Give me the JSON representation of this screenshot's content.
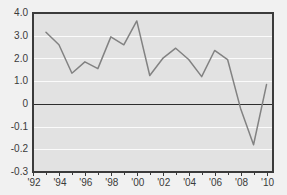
{
  "chart_data": {
    "type": "line",
    "title": "",
    "subtitle": "",
    "xlabel": "",
    "ylabel": "",
    "grid": true,
    "legend": false,
    "legend_position": "none",
    "line_color": "#828282",
    "plot_background_color": "#e2e2e2",
    "gridline_color": "#fbfbfb",
    "axis_color": "#3b3b3b",
    "zero_line_color": "#2e2e2e",
    "page_background_color": "#f1f1f1",
    "x": [
      1993,
      1994,
      1995,
      1996,
      1997,
      1998,
      1999,
      2000,
      2001,
      2002,
      2003,
      2004,
      2005,
      2006,
      2007,
      2008,
      2009,
      2010
    ],
    "values": [
      3.15,
      2.6,
      1.35,
      1.85,
      1.55,
      2.95,
      2.6,
      3.65,
      1.25,
      2.0,
      2.45,
      1.95,
      1.2,
      2.35,
      1.95,
      -0.02,
      -0.18,
      0.85
    ],
    "series": [
      {
        "name": "",
        "values": [
          3.15,
          2.6,
          1.35,
          1.85,
          1.55,
          2.95,
          2.6,
          3.65,
          1.25,
          2.0,
          2.45,
          1.95,
          1.2,
          2.35,
          1.95,
          -0.02,
          -0.18,
          0.85
        ]
      }
    ],
    "ylim": [
      -0.3,
      4.0
    ],
    "xlim": [
      1992,
      2010.5
    ],
    "ytick_values": [
      4.0,
      3.0,
      2.0,
      1.0,
      0,
      -0.1,
      -0.2,
      -0.3
    ],
    "ytick_labels": [
      "4.0",
      "3.0",
      "2.0",
      "1.0",
      "0",
      "-0.1",
      "-0.2",
      "-0.3"
    ],
    "y_axis_note": "gridlines equally spaced though numeric intervals differ",
    "xtick_values": [
      1992,
      1994,
      1996,
      1998,
      2000,
      2002,
      2004,
      2006,
      2008,
      2010
    ],
    "xtick_labels": [
      "'92",
      "'94",
      "'96",
      "'98",
      "'00",
      "'02",
      "'04",
      "'06",
      "'08",
      "'10"
    ],
    "x_minor_ticks": [
      1993,
      1995,
      1997,
      1999,
      2001,
      2003,
      2005,
      2007,
      2009
    ],
    "annotations": []
  }
}
